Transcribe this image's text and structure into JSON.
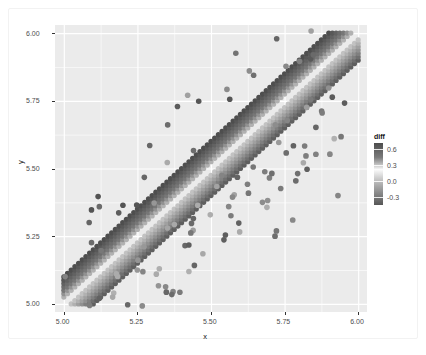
{
  "chart_data": {
    "type": "scatter",
    "title": "",
    "subtitle": "",
    "xlabel": "x",
    "ylabel": "y",
    "xlim": [
      4.97,
      6.03
    ],
    "ylim": [
      4.97,
      6.03
    ],
    "xticks": [
      "5.00",
      "5.25",
      "5.50",
      "5.75",
      "6.00"
    ],
    "xtick_values": [
      5.0,
      5.25,
      5.5,
      5.75,
      6.0
    ],
    "yticks": [
      "5.00",
      "5.25",
      "5.50",
      "5.75",
      "6.00"
    ],
    "ytick_values": [
      5.0,
      5.25,
      5.5,
      5.75,
      6.0
    ],
    "grid": true,
    "grid_color": "#ffffff",
    "panel_background": "#ebebeb",
    "point_shape": "circle",
    "point_size": 2.6,
    "color_mapping": {
      "variable": "diff",
      "legend_title": "diff",
      "legend_position": "right",
      "type": "continuous_gradient",
      "ticks": [
        "0.6",
        "0.3",
        "0.0",
        "-0.3"
      ],
      "tick_values": [
        0.6,
        0.3,
        0.0,
        -0.3
      ],
      "range": [
        -0.45,
        0.72
      ],
      "stops": [
        {
          "value": 0.72,
          "color": "#4d4d4d"
        },
        {
          "value": 0.45,
          "color": "#7a7a7a"
        },
        {
          "value": 0.3,
          "color": "#c8c8c8"
        },
        {
          "value": 0.22,
          "color": "#fbfbfb"
        },
        {
          "value": 0.1,
          "color": "#d9d9d9"
        },
        {
          "value": 0.0,
          "color": "#bdbdbd"
        },
        {
          "value": -0.2,
          "color": "#8f8f8f"
        },
        {
          "value": -0.45,
          "color": "#565656"
        }
      ]
    },
    "lattice": {
      "x_start": 5.0,
      "x_end": 6.0,
      "y_start": 5.0,
      "y_end": 6.0,
      "step": 0.0125,
      "band_half_width": 0.105,
      "diagonal_gap": 0.02
    },
    "outliers_count": 120,
    "series": [
      {
        "name": "diff",
        "n_points": 4200
      }
    ]
  },
  "axes": {
    "x": {
      "label": "x",
      "ticks": [
        "5.00",
        "5.25",
        "5.50",
        "5.75",
        "6.00"
      ]
    },
    "y": {
      "label": "y",
      "ticks": [
        "6.00",
        "5.75",
        "5.50",
        "5.25",
        "5.00"
      ]
    }
  },
  "legend": {
    "title": "diff",
    "labels": [
      "0.6",
      "0.3",
      "0.0",
      "-0.3"
    ]
  }
}
